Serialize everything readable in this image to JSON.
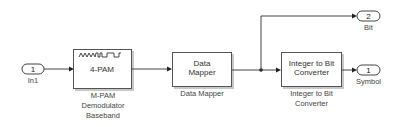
{
  "diagram": {
    "type": "simulink-block-diagram",
    "blocks": {
      "in1": {
        "port_number": "1",
        "label": "In1",
        "kind": "inport"
      },
      "mpam": {
        "icon_text": "4-PAM",
        "icon": "pam-waveform-icon",
        "label_lines": [
          "M-PAM",
          "Demodulator",
          "Baseband"
        ]
      },
      "mapper": {
        "icon_lines": [
          "Data",
          "Mapper"
        ],
        "label": "Data Mapper"
      },
      "int2bit": {
        "icon_lines": [
          "Integer to Bit",
          "Converter"
        ],
        "label_lines": [
          "Integer to Bit",
          "Converter"
        ]
      },
      "bit_out": {
        "port_number": "2",
        "label": "Bit",
        "kind": "outport"
      },
      "symbol_out": {
        "port_number": "1",
        "label": "Symbol",
        "kind": "outport"
      }
    },
    "connections": [
      {
        "from": "In1",
        "to": "M-PAM Demodulator Baseband"
      },
      {
        "from": "M-PAM Demodulator Baseband",
        "to": "Data Mapper"
      },
      {
        "from": "Data Mapper",
        "to": "Integer to Bit Converter"
      },
      {
        "from": "Data Mapper",
        "to": "Bit"
      },
      {
        "from": "Integer to Bit Converter",
        "to": "Symbol"
      }
    ]
  }
}
